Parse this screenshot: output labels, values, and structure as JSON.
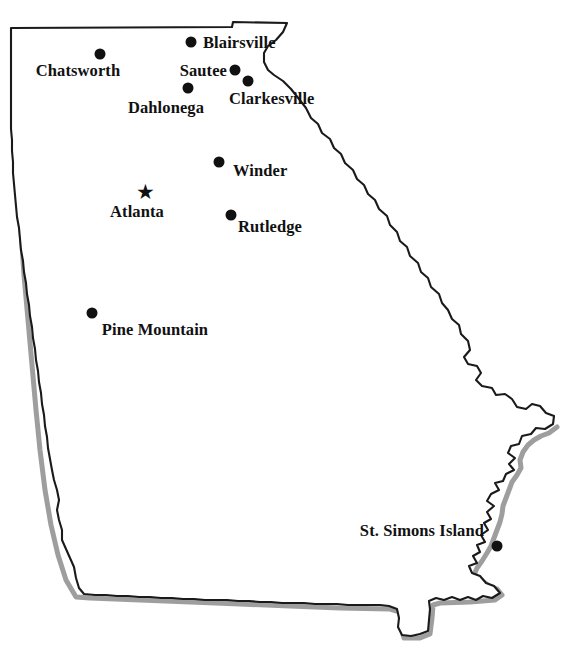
{
  "map": {
    "title": "Georgia City Locator Map",
    "region": "Georgia",
    "background_color": "#ffffff",
    "outline_color": "#1a1a1a",
    "shadow_color": "#8d8d8d",
    "marker_color": "#111111",
    "capital_marker": "star",
    "city_marker": "filled-circle"
  },
  "places": [
    {
      "name": "Blairsville",
      "label": "Blairsville",
      "marker": "dot",
      "dot_x": 191,
      "dot_y": 42,
      "label_x": 203,
      "label_y": 43,
      "align": "left"
    },
    {
      "name": "Chatsworth",
      "label": "Chatsworth",
      "marker": "dot",
      "dot_x": 100,
      "dot_y": 54,
      "label_x": 78,
      "label_y": 71,
      "align": "center"
    },
    {
      "name": "Sautee",
      "label": "Sautee",
      "marker": "dot",
      "dot_x": 235,
      "dot_y": 70,
      "label_x": 227,
      "label_y": 71,
      "align": "right"
    },
    {
      "name": "Clarkesville",
      "label": "Clarkesville",
      "marker": "dot",
      "dot_x": 248,
      "dot_y": 81,
      "label_x": 229,
      "label_y": 99,
      "align": "left"
    },
    {
      "name": "Dahlonega",
      "label": "Dahlonega",
      "marker": "dot",
      "dot_x": 188,
      "dot_y": 88,
      "label_x": 166,
      "label_y": 108,
      "align": "center"
    },
    {
      "name": "Winder",
      "label": "Winder",
      "marker": "dot",
      "dot_x": 219,
      "dot_y": 162,
      "label_x": 233,
      "label_y": 171,
      "align": "left"
    },
    {
      "name": "Atlanta",
      "label": "Atlanta",
      "marker": "star",
      "dot_x": 145,
      "dot_y": 192,
      "label_x": 137,
      "label_y": 212,
      "align": "center"
    },
    {
      "name": "Rutledge",
      "label": "Rutledge",
      "marker": "dot",
      "dot_x": 231,
      "dot_y": 215,
      "label_x": 238,
      "label_y": 227,
      "align": "left"
    },
    {
      "name": "Pine Mountain",
      "label": "Pine Mountain",
      "marker": "dot",
      "dot_x": 92,
      "dot_y": 313,
      "label_x": 155,
      "label_y": 330,
      "align": "center"
    },
    {
      "name": "St. Simons Island",
      "label": "St. Simons Island",
      "marker": "dot",
      "dot_x": 497,
      "dot_y": 546,
      "label_x": 484,
      "label_y": 531,
      "align": "right"
    }
  ],
  "outline_path": "M 11,28 L 232,27 L 233,22 L 287,23 L 283,32 L 276,40 L 268,46 L 264,53 L 264,62 L 268,70 L 274,75 L 283,81 L 291,89 L 299,99 L 306,108 L 311,118 L 318,124 L 322,133 L 330,139 L 334,148 L 341,154 L 345,163 L 353,170 L 357,179 L 364,185 L 368,194 L 375,200 L 379,209 L 387,216 L 390,225 L 397,232 L 400,241 L 407,247 L 410,256 L 418,263 L 421,272 L 428,278 L 431,287 L 439,294 L 442,303 L 448,310 L 452,319 L 459,325 L 461,334 L 468,341 L 470,350 L 464,357 L 468,364 L 477,366 L 481,373 L 476,380 L 482,386 L 492,388 L 496,395 L 505,394 L 512,399 L 517,407 L 526,409 L 532,404 L 540,406 L 546,413 L 554,416 L 553,424 L 545,429 L 536,428 L 531,434 L 522,436 L 519,444 L 511,446 L 508,453 L 515,458 L 509,464 L 514,470 L 506,474 L 503,481 L 495,483 L 499,490 L 491,494 L 487,501 L 494,506 L 487,512 L 491,519 L 484,523 L 488,530 L 481,535 L 485,542 L 477,545 L 480,552 L 473,556 L 477,563 L 469,566 L 472,573 L 480,576 L 486,583 L 494,586 L 500,593 L 492,598 L 483,596 L 476,600 L 468,597 L 460,600 L 452,597 L 444,600 L 436,598 L 429,601 L 430,609 L 429,620 L 428,631 L 420,634 L 411,636 L 402,635 L 398,627 L 399,618 L 397,609 L 389,606 L 380,605 L 370,605 L 359,605 L 348,605 L 337,604 L 326,604 L 315,604 L 304,603 L 293,603 L 282,603 L 271,602 L 260,602 L 249,601 L 238,601 L 227,600 L 216,600 L 205,600 L 194,599 L 183,599 L 172,598 L 161,598 L 150,597 L 139,597 L 128,596 L 117,596 L 106,595 L 95,595 L 84,594 L 79,588 L 76,578 L 74,567 L 70,558 L 66,549 L 62,540 L 62,530 L 59,520 L 57,510 L 59,500 L 57,490 L 54,480 L 52,470 L 50,459 L 48,448 L 47,437 L 45,426 L 44,415 L 42,404 L 41,393 L 39,382 L 38,371 L 36,360 L 35,349 L 33,338 L 32,327 L 30,316 L 29,305 L 27,294 L 26,283 L 24,272 L 23,261 L 21,250 L 20,239 L 19,228 L 17,217 L 16,206 L 15,195 L 14,184 L 13,173 L 13,162 L 12,151 L 12,140 L 11,129 L 11,118 L 11,107 L 11,96 L 11,85 L 11,74 L 11,63 L 11,52 L 11,40 Z",
  "shadow_path": "M 13,31 L 14,80 L 16,130 L 18,180 L 21,230 L 24,275 L 28,320 L 32,365 L 36,410 L 40,450 L 45,490 L 51,525 L 58,555 L 66,580 L 76,597 L 90,598 L 140,600 L 190,602 L 240,604 L 290,606 L 340,608 L 390,609 L 400,612 L 401,627 L 404,638 L 420,638 L 430,634 L 432,618 L 433,605 L 440,603 L 470,602 L 495,600 L 502,595 L 497,589 L 489,586 L 481,580 L 474,575 L 477,568 L 482,561 L 487,553 L 491,546 L 494,538 L 497,530 L 500,522 L 502,514 L 503,506 L 506,498 L 509,490 L 512,482 L 517,475 L 521,468 L 520,460 L 523,452 L 528,445 L 534,440 L 541,436 L 549,433 L 557,427"
}
